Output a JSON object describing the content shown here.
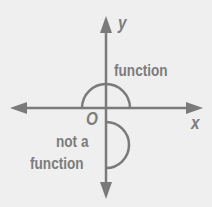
{
  "diagram": {
    "axes": {
      "x_label": "x",
      "y_label": "y",
      "origin_label": "O"
    },
    "curves": [
      {
        "name": "upper-semicircle",
        "label": "function"
      },
      {
        "name": "right-semicircle",
        "label_line1": "not a",
        "label_line2": "function"
      }
    ],
    "colors": {
      "line": "#7a7a7a",
      "text": "#7c7c7c",
      "background": "#efefef"
    }
  }
}
